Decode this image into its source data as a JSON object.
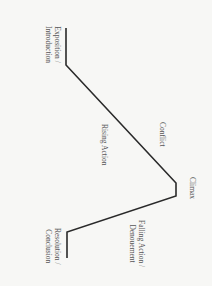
{
  "diagram": {
    "orientation": "rotated 90 degrees clockwise",
    "line_color": "#2a2a2a",
    "label_color": "#555555",
    "nodes": [
      {
        "id": "exposition",
        "label_line1": "Exposition /",
        "label_line2": "Introduction"
      },
      {
        "id": "rising",
        "label": "Rising Action"
      },
      {
        "id": "conflict",
        "label": "Conflict"
      },
      {
        "id": "climax",
        "label": "Climax"
      },
      {
        "id": "falling",
        "label_line1": "Falling Action /",
        "label_line2": "Denouement"
      },
      {
        "id": "resolution",
        "label_line1": "Resolution /",
        "label_line2": "Conclusion"
      }
    ],
    "edges": [
      {
        "from": "exposition",
        "to": "climax",
        "via": "rising"
      },
      {
        "from": "climax",
        "to": "resolution",
        "via": "falling"
      }
    ]
  }
}
